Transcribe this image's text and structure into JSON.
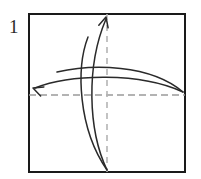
{
  "figure": {
    "kind": "origami-fold-diagram",
    "step_label": "1",
    "background_color": "#ffffff"
  },
  "paper": {
    "name": "square-sheet",
    "shape": "square",
    "x": 29,
    "y": 14,
    "width": 156,
    "height": 158,
    "stroke_color": "#1a1a1a",
    "stroke_width": 2,
    "fill_color": "#ffffff"
  },
  "fold_lines": [
    {
      "name": "horizontal-center-crease",
      "orientation": "horizontal",
      "style": "dashed",
      "color": "#9a9a9a",
      "x1": 29,
      "y1": 95,
      "x2": 185,
      "y2": 95,
      "dash": "7 4",
      "width": 1.6
    },
    {
      "name": "vertical-center-crease",
      "orientation": "vertical",
      "style": "dashed",
      "color": "#b4b4b4",
      "x1": 107,
      "y1": 14,
      "x2": 107,
      "y2": 172,
      "dash": "6 5",
      "width": 1.6
    }
  ],
  "arrows": [
    {
      "name": "fold-arrow-up",
      "direction": "up",
      "color": "#2a2a2a",
      "path": "M 107 170 C 88 130, 86 66, 106 19",
      "head_tip_x": 106,
      "head_tip_y": 17,
      "head_angle_deg": -75
    },
    {
      "name": "fold-arrow-up-return",
      "direction": "up",
      "color": "#2a2a2a",
      "path": "M 107 170 C 78 128, 76 68, 88 37",
      "head_tip_x": null,
      "head_tip_y": null,
      "head_angle_deg": null
    },
    {
      "name": "fold-arrow-left",
      "direction": "left",
      "color": "#2a2a2a",
      "path": "M 183 92 C 140 72, 70 74, 35 88",
      "head_tip_x": 33,
      "head_tip_y": 88,
      "head_angle_deg": 200
    },
    {
      "name": "fold-arrow-left-return",
      "direction": "left",
      "color": "#2a2a2a",
      "path": "M 183 92 C 150 64, 92 64, 57 72",
      "head_tip_x": null,
      "head_tip_y": null,
      "head_angle_deg": null
    }
  ],
  "labels": {
    "step_number": {
      "text": "1",
      "x": 9,
      "y": 33,
      "color": "#2b2b2b",
      "font_size": 19
    }
  }
}
